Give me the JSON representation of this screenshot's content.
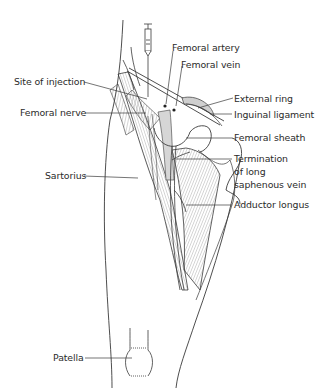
{
  "figure": {
    "labels": [
      {
        "id": "femoral-artery",
        "text": "Femoral artery",
        "side": "right"
      },
      {
        "id": "femoral-vein",
        "text": "Femoral vein",
        "side": "right"
      },
      {
        "id": "site-of-injection",
        "text": "Site of injection",
        "side": "left"
      },
      {
        "id": "external-ring",
        "text": "External ring",
        "side": "right"
      },
      {
        "id": "femoral-nerve",
        "text": "Femoral nerve",
        "side": "left"
      },
      {
        "id": "inguinal-ligament",
        "text": "Inguinal ligament",
        "side": "right"
      },
      {
        "id": "femoral-sheath",
        "text": "Femoral sheath",
        "side": "right"
      },
      {
        "id": "termination-long-saphenous-vein",
        "text": "Termination of long saphenous vein",
        "lines": [
          "Termination",
          "of long",
          "saphenous vein"
        ],
        "side": "right"
      },
      {
        "id": "sartorius",
        "text": "Sartorius",
        "side": "left"
      },
      {
        "id": "adductor-longus",
        "text": "Adductor longus",
        "side": "right"
      },
      {
        "id": "patella",
        "text": "Patella",
        "side": "left"
      }
    ],
    "colors": {
      "line": "#3a3a3a",
      "text": "#2b2b2b",
      "shade": "#cfcfcf",
      "background": "#ffffff"
    }
  }
}
